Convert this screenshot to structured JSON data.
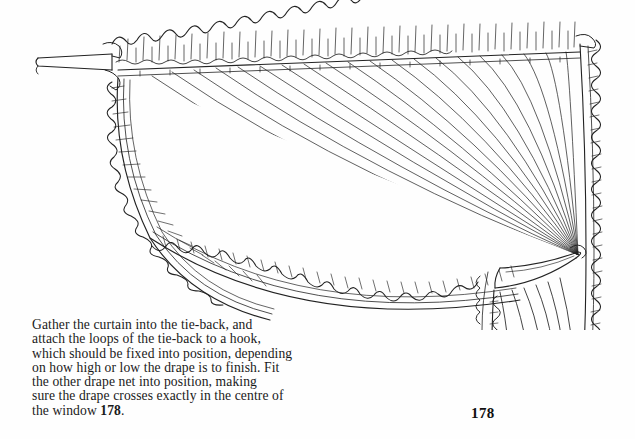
{
  "page": {
    "background_color": "#fefefe",
    "ink_color": "#1a1a1a",
    "page_number": "178"
  },
  "illustration": {
    "name": "curtain-tie-back-diagram",
    "description": "Line drawing of a gathered frilled curtain pulled into a tie-back on a rod",
    "line_color": "#222222",
    "parts": [
      {
        "name": "curtain-rod",
        "label": "curtain rod"
      },
      {
        "name": "frilled-heading",
        "label": "frilled gathered heading"
      },
      {
        "name": "heading-tape",
        "label": "heading tape"
      },
      {
        "name": "left-frilled-edge",
        "label": "left frilled leading edge"
      },
      {
        "name": "curved-frilled-hem",
        "label": "curved frilled hem"
      },
      {
        "name": "right-frilled-edge",
        "label": "right frilled side edge"
      },
      {
        "name": "tie-back-band",
        "label": "tie-back band"
      },
      {
        "name": "lower-drape",
        "label": "drape below tie-back"
      },
      {
        "name": "fold-lines",
        "label": "radiating fold lines"
      }
    ]
  },
  "caption": {
    "lines": [
      "Gather the curtain into the tie-back, and",
      "attach the loops of the tie-back to a hook,",
      "which should be fixed into position, depending",
      "on how high or low the drape is to finish. Fit",
      "the other drape net into position, making",
      "sure the drape crosses exactly in the centre of"
    ],
    "last_line_prefix": "the window ",
    "last_line_bold": "178",
    "last_line_suffix": "."
  }
}
